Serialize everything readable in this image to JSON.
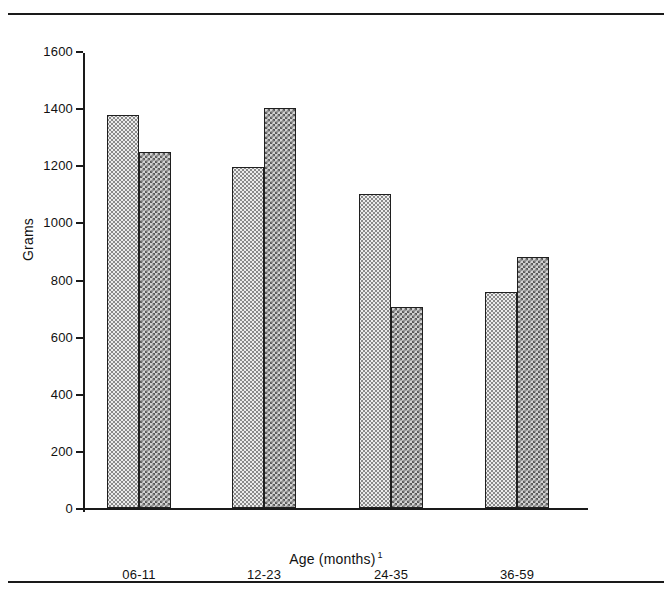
{
  "figure": {
    "top_rule": true,
    "bottom_rule": true
  },
  "chart_data": {
    "type": "bar",
    "title": "",
    "subtitle": "",
    "xlabel": "Age (months)",
    "xlabel_footnote": "1",
    "ylabel": "Grams",
    "categories": [
      "06-11",
      "12-23",
      "24-35",
      "36-59"
    ],
    "ylim": [
      0,
      1600
    ],
    "yticks": [
      0,
      200,
      400,
      600,
      800,
      1000,
      1200,
      1400,
      1600
    ],
    "ytick_labels": [
      "0",
      "200",
      "400",
      "600",
      "800",
      "1000",
      "1200",
      "1400",
      "1600"
    ],
    "grid": false,
    "legend": "none",
    "series": [
      {
        "name": "series-1",
        "pattern": "light-dotted",
        "color": "#ececec",
        "values": [
          1375,
          1195,
          1100,
          755
        ]
      },
      {
        "name": "series-2",
        "pattern": "dark-checkered",
        "color": "#9a9a9a",
        "values": [
          1245,
          1400,
          705,
          880
        ]
      }
    ]
  }
}
